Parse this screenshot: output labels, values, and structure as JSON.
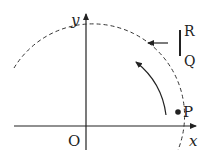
{
  "diagram": {
    "axes": {
      "x_label": "x",
      "y_label": "y",
      "origin_label": "O"
    },
    "point": {
      "label": "P"
    },
    "screen": {
      "top_label": "R",
      "bottom_label": "Q"
    },
    "colors": {
      "ink": "#222222",
      "background": "#ffffff"
    }
  }
}
